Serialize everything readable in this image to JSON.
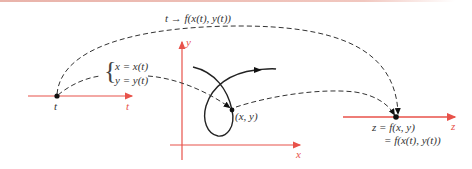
{
  "colors": {
    "axis": "#e8524a",
    "curve": "#222222",
    "dashed": "#333333",
    "top_rule": "#eab8ae"
  },
  "labels": {
    "top_mapping": "t → f(x(t), y(t))",
    "param_x": "x  =  x(t)",
    "param_y": "y  =  y(t)",
    "t_point": "t",
    "t_axis": "t",
    "y_axis": "y",
    "x_axis": "x",
    "point_xy": "(x, y)",
    "z_eq1": "z  =  f(x, y)",
    "z_eq2": "=  f(x(t), y(t))",
    "z_axis": "z"
  }
}
